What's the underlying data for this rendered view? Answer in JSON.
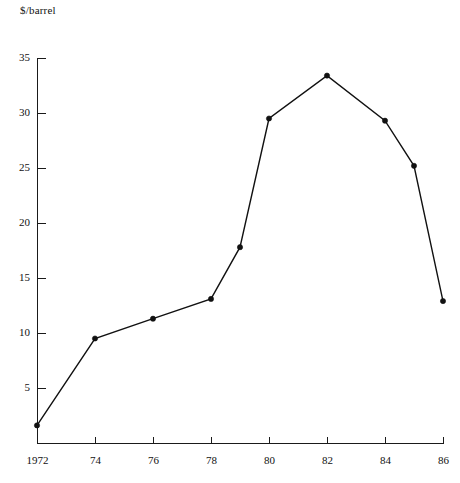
{
  "chart_data": {
    "type": "line",
    "title": "",
    "subtitle": "",
    "xlabel": "",
    "ylabel": "$/barrel",
    "ylabel_position": "top-left",
    "grid": false,
    "legend": false,
    "legend_position": "none",
    "line_color": "#111111",
    "marker_color": "#111111",
    "axis_color": "#1a1a1a",
    "background_color": "#ffffff",
    "xlim": [
      1972,
      1986
    ],
    "ylim": [
      0,
      35
    ],
    "y_ticks": [
      5,
      10,
      15,
      20,
      25,
      30,
      35
    ],
    "y_tick_labels": [
      "5",
      "10",
      "15",
      "20",
      "25",
      "30",
      "35"
    ],
    "x_ticks": [
      1972,
      1974,
      1976,
      1978,
      1980,
      1982,
      1984,
      1986
    ],
    "x_tick_labels": [
      "1972",
      "74",
      "76",
      "78",
      "80",
      "82",
      "84",
      "86"
    ],
    "x": [
      1972,
      1974,
      1976,
      1978,
      1979,
      1980,
      1982,
      1984,
      1985,
      1986
    ],
    "values": [
      1.6,
      9.5,
      11.3,
      13.1,
      17.8,
      29.5,
      33.4,
      29.3,
      25.2,
      12.9
    ],
    "series": [
      {
        "name": "$/barrel",
        "x": [
          1972,
          1974,
          1976,
          1978,
          1979,
          1980,
          1982,
          1984,
          1985,
          1986
        ],
        "values": [
          1.6,
          9.5,
          11.3,
          13.1,
          17.8,
          29.5,
          33.4,
          29.3,
          25.2,
          12.9
        ]
      }
    ],
    "annotations": []
  },
  "geometry": {
    "plot_left": 37,
    "plot_bottom": 443,
    "plot_right": 443,
    "y_zero_px": 443,
    "px_per_unit_y": 11.0,
    "px_per_year_x": 29.0
  }
}
